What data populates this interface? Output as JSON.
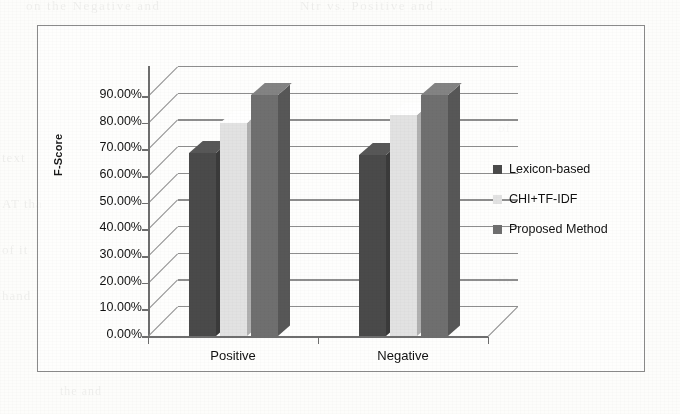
{
  "figure": {
    "background_color": "#fdfdfb",
    "frame_color": "#8b8b8b"
  },
  "ghost_text": {
    "top_left": "on the Negative and",
    "top_right": "Ntr vs. Positive and ...",
    "left_1": "text",
    "left_2": "AT tha",
    "left_3": "of it",
    "left_4": "hand",
    "right_1": "of",
    "right_2": "the",
    "bottom": "the and"
  },
  "chart_data": {
    "type": "bar",
    "title": "",
    "xlabel": "",
    "ylabel": "F-Score",
    "categories": [
      "Positive",
      "Negative"
    ],
    "series": [
      {
        "name": "Lexicon-based",
        "values": [
          68.5,
          68.0
        ],
        "color": "#4a4a4a"
      },
      {
        "name": "CHI+TF-IDF",
        "values": [
          80.0,
          83.0
        ],
        "color": "#e2e2e2"
      },
      {
        "name": "Proposed Method",
        "values": [
          90.5,
          90.5
        ],
        "color": "#6f6f6f"
      }
    ],
    "ylim": [
      0,
      90
    ],
    "ytick_labels": [
      "90.00%",
      "80.00%",
      "70.00%",
      "60.00%",
      "50.00%",
      "40.00%",
      "30.00%",
      "20.00%",
      "10.00%",
      "0.00%"
    ],
    "ytick_values": [
      90,
      80,
      70,
      60,
      50,
      40,
      30,
      20,
      10,
      0
    ],
    "grid": true,
    "grid_axis": "y",
    "legend_position": "right",
    "three_d": true
  }
}
